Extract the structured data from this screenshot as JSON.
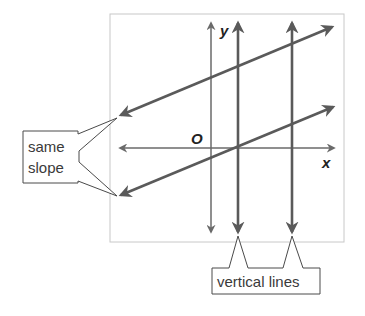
{
  "diagram": {
    "axes": {
      "x_label": "x",
      "y_label": "y",
      "origin_label": "O"
    },
    "callouts": {
      "slope": {
        "line1": "same",
        "line2": "slope"
      },
      "vertical": {
        "text": "vertical lines"
      }
    },
    "colors": {
      "line": "#5a5a5a",
      "frame": "#c8c8c8",
      "text": "#3a3a3a",
      "background": "#ffffff"
    },
    "lines": [
      {
        "type": "axis",
        "name": "x-axis"
      },
      {
        "type": "axis",
        "name": "y-axis"
      },
      {
        "type": "vertical",
        "name": "vertical-line-1"
      },
      {
        "type": "vertical",
        "name": "vertical-line-2"
      },
      {
        "type": "parallel",
        "name": "parallel-line-upper"
      },
      {
        "type": "parallel",
        "name": "parallel-line-lower"
      }
    ]
  }
}
